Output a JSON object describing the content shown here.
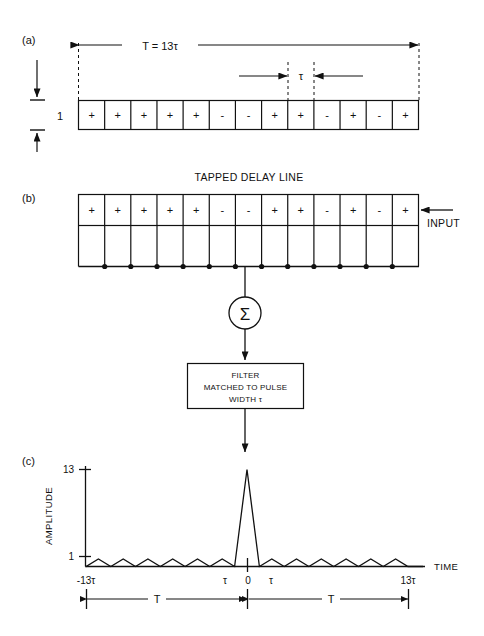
{
  "figure": {
    "panels": [
      {
        "id": "a",
        "label": "(a)"
      },
      {
        "id": "b",
        "label": "(b)"
      },
      {
        "id": "c",
        "label": "(c)"
      }
    ]
  },
  "panel_a": {
    "total_duration_label": "T = 13τ",
    "subpulse_label": "τ",
    "amplitude_label": "1",
    "code_name": "13-element Barker code",
    "code_signs": [
      "+",
      "+",
      "+",
      "+",
      "+",
      "-",
      "-",
      "+",
      "+",
      "-",
      "+",
      "-",
      "+"
    ],
    "code_values": [
      1,
      1,
      1,
      1,
      1,
      -1,
      -1,
      1,
      1,
      -1,
      1,
      -1,
      1
    ],
    "n_elements": 13
  },
  "panel_b": {
    "title": "TAPPED DELAY LINE",
    "input_label": "INPUT",
    "code_signs": [
      "+",
      "+",
      "+",
      "+",
      "+",
      "-",
      "-",
      "+",
      "+",
      "-",
      "+",
      "-",
      "+"
    ],
    "n_taps": 14,
    "n_junction_dots": 12,
    "summer_symbol": "Σ",
    "filter_box_lines": [
      "FILTER",
      "MATCHED TO PULSE",
      "WIDTH  τ"
    ]
  },
  "panel_c": {
    "ylabel": "AMPLITUDE",
    "xlabel": "TIME",
    "ytick_labels": [
      "13",
      "1"
    ],
    "ytick_values": [
      13,
      1
    ],
    "xtick_labels": [
      "-13τ",
      "τ",
      "0",
      "τ",
      "13τ"
    ],
    "span_left_label": "T",
    "span_right_label": "T"
  },
  "chart_data": {
    "type": "line",
    "xlabel": "TIME",
    "ylabel": "AMPLITUDE",
    "ylim": [
      0,
      13
    ],
    "xlim": [
      -13,
      13
    ],
    "grid": false,
    "legend": null,
    "xtick_positions": [
      -13,
      -1,
      0,
      1,
      13
    ],
    "xtick_labels": [
      "-13τ",
      "τ",
      "0",
      "τ",
      "13τ"
    ],
    "ytick_positions": [
      1,
      13
    ],
    "ytick_labels": [
      "1",
      "13"
    ],
    "annotations": [
      {
        "text": "T",
        "from": -13,
        "to": 0,
        "kind": "double-arrow-span"
      },
      {
        "text": "T",
        "from": 0,
        "to": 13,
        "kind": "double-arrow-span"
      }
    ],
    "x": [
      -13,
      -12,
      -11,
      -10,
      -9,
      -8,
      -7,
      -6,
      -5,
      -4,
      -3,
      -2,
      -1,
      0,
      1,
      2,
      3,
      4,
      5,
      6,
      7,
      8,
      9,
      10,
      11,
      12,
      13
    ],
    "values": [
      0,
      1,
      0,
      1,
      0,
      1,
      0,
      1,
      0,
      1,
      0,
      1,
      0,
      13,
      0,
      1,
      0,
      1,
      0,
      1,
      0,
      1,
      0,
      1,
      0,
      1,
      0
    ],
    "sidelobe_level": 1,
    "peak_level": 13,
    "n_sidelobes_each_side": 6
  }
}
